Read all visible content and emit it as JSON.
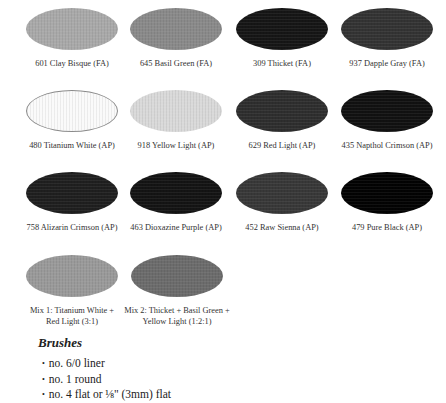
{
  "swatches": [
    {
      "label": "601 Clay Bisque (FA)",
      "color": "#a9a9a9"
    },
    {
      "label": "645 Basil Green (FA)",
      "color": "#8a8a8a"
    },
    {
      "label": "309 Thicket (FA)",
      "color": "#161616"
    },
    {
      "label": "937 Dapple Gray (FA)",
      "color": "#333333"
    },
    {
      "label": "480 Titanium White (AP)",
      "color": "#fafafa"
    },
    {
      "label": "918 Yellow Light (AP)",
      "color": "#d9d9d9"
    },
    {
      "label": "629 Red Light (AP)",
      "color": "#2e2e2e"
    },
    {
      "label": "435 Napthol Crimson (AP)",
      "color": "#111111"
    },
    {
      "label": "758 Alizarin Crimson (AP)",
      "color": "#1f1f1f"
    },
    {
      "label": "463 Dioxazine Purple (AP)",
      "color": "#141414"
    },
    {
      "label": "452 Raw Sienna (AP)",
      "color": "#383838"
    },
    {
      "label": "479 Pure Black (AP)",
      "color": "#030303"
    }
  ],
  "mixes": [
    {
      "label": "Mix 1: Titanium White + Red Light (3:1)",
      "color": "#9a9a9a"
    },
    {
      "label": "Mix 2: Thicket + Basil Green + Yellow Light (1:2:1)",
      "color": "#6c6c6c"
    }
  ],
  "brushes": {
    "heading": "Brushes",
    "bullet": "•",
    "items": [
      "no. 6/0 liner",
      "no. 1 round",
      "no. 4 flat or ⅛\" (3mm) flat"
    ]
  }
}
